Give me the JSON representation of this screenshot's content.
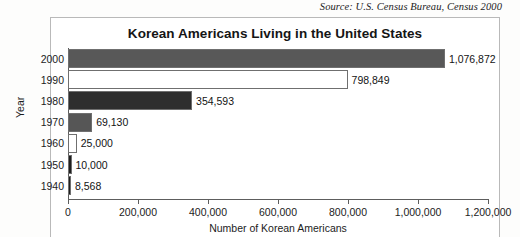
{
  "source_note": "Source: U.S. Census Bureau, Census 2000",
  "chart_data": {
    "type": "bar",
    "orientation": "horizontal",
    "title": "Korean Americans Living in the United States",
    "xlabel": "Number of Korean Americans",
    "ylabel": "Year",
    "categories": [
      "2000",
      "1990",
      "1980",
      "1970",
      "1960",
      "1950",
      "1940"
    ],
    "values": [
      1076872,
      798849,
      354593,
      69130,
      25000,
      10000,
      8568
    ],
    "value_labels": [
      "1,076,872",
      "798,849",
      "354,593",
      "69,130",
      "25,000",
      "10,000",
      "8,568"
    ],
    "bar_colors": [
      "#585858",
      "#ffffff",
      "#2e2e2e",
      "#565656",
      "#ffffff",
      "#1e1e1e",
      "#1e1e1e"
    ],
    "xlim": [
      0,
      1200000
    ],
    "xticks": [
      0,
      200000,
      400000,
      600000,
      800000,
      1000000,
      1200000
    ],
    "xtick_labels": [
      "0",
      "200,000",
      "400,000",
      "600,000",
      "800,000",
      "1,000,000",
      "1,200,000"
    ],
    "grid": false,
    "legend": "none"
  }
}
